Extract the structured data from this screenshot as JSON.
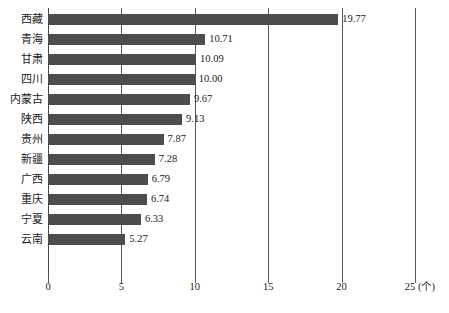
{
  "chart_data": {
    "type": "bar",
    "orientation": "horizontal",
    "title": "",
    "xlabel": "(个)",
    "ylabel": "",
    "xlim": [
      0,
      25
    ],
    "xticks": [
      0,
      5,
      10,
      15,
      20,
      25
    ],
    "xtick_labels": [
      "0",
      "5",
      "10",
      "15",
      "20",
      "25 (个)"
    ],
    "grid": true,
    "legend": null,
    "categories": [
      "西藏",
      "青海",
      "甘肃",
      "四川",
      "内蒙古",
      "陕西",
      "贵州",
      "新疆",
      "广西",
      "重庆",
      "宁夏",
      "云南"
    ],
    "values": [
      19.77,
      10.71,
      10.09,
      10.0,
      9.67,
      9.13,
      7.87,
      7.28,
      6.79,
      6.74,
      6.33,
      5.27
    ],
    "value_labels": [
      "19.77",
      "10.71",
      "10.09",
      "10.00",
      "9.67",
      "9.13",
      "7.87",
      "7.28",
      "6.79",
      "6.74",
      "6.33",
      "5.27"
    ],
    "bar_color": "#4d4d4d",
    "axis_color": "#5a5a5a",
    "background_color": "#ffffff"
  },
  "axis": {
    "unit_suffix": "(个)"
  }
}
